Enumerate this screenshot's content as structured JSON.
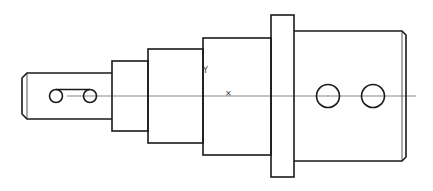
{
  "drawing": {
    "type": "technical-drawing",
    "subject": "stepped shaft side view",
    "colors": {
      "line": "#1a1a1a",
      "centerline": "#555555",
      "background": "#ffffff"
    },
    "markers": {
      "ucs_y_label": "Y",
      "ucs_x_label": "X",
      "origin_cross": "×"
    },
    "features": {
      "shaft_tip": {
        "x": 22,
        "y_top": 73,
        "y_bottom": 119,
        "right": 112,
        "chamfer": 5
      },
      "slot": {
        "left_circle": [
          56,
          96,
          6.5
        ],
        "right_circle": [
          90,
          96,
          6.5
        ]
      },
      "step_2": {
        "x1": 112,
        "x2": 148,
        "y1": 61,
        "y2": 131
      },
      "step_3": {
        "x1": 148,
        "x2": 203,
        "y1": 49,
        "y2": 143
      },
      "step_4": {
        "x1": 203,
        "x2": 271,
        "y1": 38,
        "y2": 155
      },
      "flange": {
        "x1": 271,
        "x2": 294,
        "y1": 15,
        "y2": 177
      },
      "body": {
        "x1": 294,
        "x2": 402,
        "y1": 31,
        "y2": 161,
        "chamfer_to": 406
      },
      "holes": [
        [
          328,
          96,
          11.5
        ],
        [
          373,
          96,
          11.5
        ]
      ],
      "centerline_y": 96
    }
  }
}
